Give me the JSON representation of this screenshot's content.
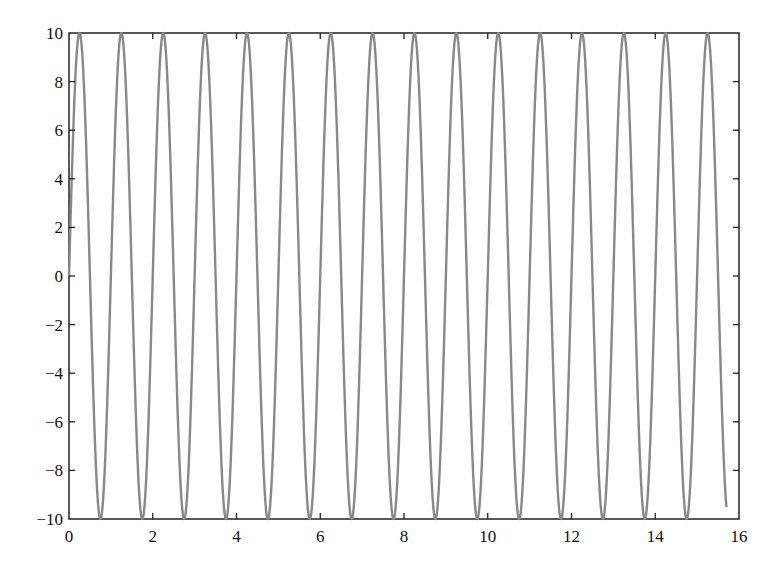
{
  "chart_data": {
    "type": "line",
    "title": "",
    "xlabel": "",
    "ylabel": "",
    "xlim": [
      0,
      16
    ],
    "ylim": [
      -10,
      10
    ],
    "grid": false,
    "legend": null,
    "x_ticks": [
      0,
      2,
      4,
      6,
      8,
      10,
      12,
      14,
      16
    ],
    "y_ticks": [
      -10,
      -8,
      -6,
      -4,
      -2,
      0,
      2,
      4,
      6,
      8,
      10
    ],
    "x_tick_labels": [
      "0",
      "2",
      "4",
      "6",
      "8",
      "10",
      "12",
      "14",
      "16"
    ],
    "y_tick_labels": [
      "−10",
      "−8",
      "−6",
      "−4",
      "−2",
      "0",
      "2",
      "4",
      "6",
      "8",
      "10"
    ],
    "series": [
      {
        "name": "10*sin(2*pi*x)",
        "color": "#888888",
        "function": "y = 10*sin(2*pi*x)",
        "x_range": [
          0,
          15.7
        ],
        "amplitude": 10,
        "period": 1.0,
        "peaks_x": [
          0.25,
          1.25,
          2.25,
          3.25,
          4.25,
          5.25,
          6.25,
          7.25,
          8.25,
          9.25,
          10.25,
          11.25,
          12.25,
          13.25,
          14.25,
          15.25
        ],
        "troughs_x": [
          0.75,
          1.75,
          2.75,
          3.75,
          4.75,
          5.75,
          6.75,
          7.75,
          8.75,
          9.75,
          10.75,
          11.75,
          12.75,
          13.75,
          14.75
        ],
        "end_point": [
          15.7,
          -9.5
        ]
      }
    ]
  },
  "colors": {
    "line": "#888888",
    "axes": "#222222",
    "background": "#ffffff"
  }
}
